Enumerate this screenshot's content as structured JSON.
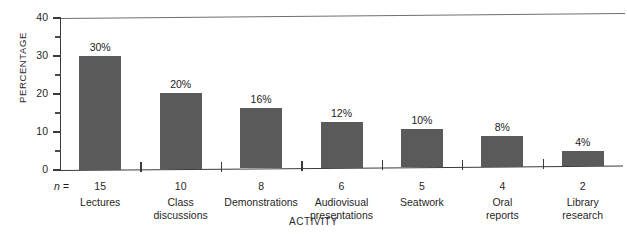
{
  "chart_data": {
    "type": "bar",
    "title": "",
    "xlabel": "ACTIVITY",
    "ylabel": "PERCENTAGE",
    "ylim": [
      0,
      40
    ],
    "yticks": [
      0,
      10,
      20,
      30,
      40
    ],
    "ytick_labels": [
      "0",
      "10",
      "20",
      "30",
      "40"
    ],
    "yminor_ticks": [
      5,
      15,
      25,
      35
    ],
    "grid": false,
    "legend": "none",
    "n_prefix": "n =",
    "categories": [
      "Lectures",
      "Class discussions",
      "Demonstrations",
      "Audiovisual presentations",
      "Seatwork",
      "Oral reports",
      "Library research"
    ],
    "values": [
      30,
      20,
      16,
      12,
      10,
      8,
      4
    ],
    "value_labels": [
      "30%",
      "20%",
      "16%",
      "12%",
      "10%",
      "8%",
      "4%"
    ],
    "n_values": [
      15,
      10,
      8,
      6,
      5,
      4,
      2
    ],
    "n_labels": [
      "15",
      "10",
      "8",
      "6",
      "5",
      "4",
      "2"
    ],
    "category_lines": [
      [
        "Lectures"
      ],
      [
        "Class",
        "discussions"
      ],
      [
        "Demonstrations"
      ],
      [
        "Audiovisual",
        "presentations"
      ],
      [
        "Seatwork"
      ],
      [
        "Oral",
        "reports"
      ],
      [
        "Library",
        "research"
      ]
    ],
    "bar_color": "#5a5a5a",
    "axis_color": "#3a3a3a",
    "background": "#ffffff"
  },
  "footer": {
    "clipped_text": ""
  }
}
